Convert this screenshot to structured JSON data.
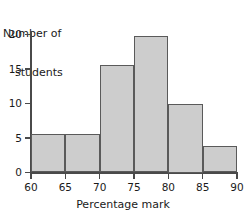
{
  "chart_data": {
    "type": "bar",
    "title": "",
    "subtitle": "",
    "xlabel": "Percentage mark",
    "ylabel": "Number of students",
    "ylabel_line1": "Number of",
    "ylabel_line2": "students",
    "categories": [
      "60-65",
      "65-70",
      "70-75",
      "75-80",
      "80-85",
      "85-90"
    ],
    "bin_edges": [
      60,
      65,
      70,
      75,
      80,
      85,
      90
    ],
    "values": [
      5.6,
      5.6,
      15.6,
      19.8,
      10,
      3.8
    ],
    "xlim": [
      60,
      90
    ],
    "ylim": [
      0,
      21
    ],
    "xticks": [
      60,
      65,
      70,
      75,
      80,
      85,
      90
    ],
    "yticks": [
      0,
      5,
      10,
      15,
      20
    ],
    "xtick_labels": [
      "60",
      "65",
      "70",
      "75",
      "80",
      "85",
      "90"
    ],
    "ytick_labels": [
      "0",
      "5",
      "10",
      "15",
      "20"
    ],
    "grid": false,
    "legend": null,
    "bar_fill_color": "#cdcdcd",
    "bar_border_color": "#5a5a5a",
    "axis_color": "#4a4a4a",
    "text_color": "#1a1a1a",
    "background_color": "#ffffff"
  }
}
